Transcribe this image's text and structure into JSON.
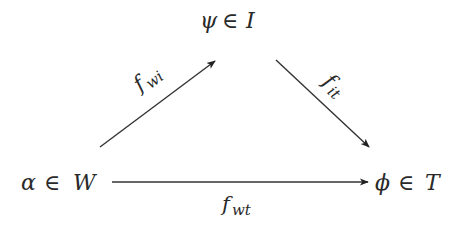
{
  "diagram": {
    "type": "commutative-diagram",
    "nodes": {
      "top": {
        "var": "ψ",
        "rel": "∈",
        "set": "I",
        "label": "ψ ∈ I"
      },
      "left": {
        "var": "α",
        "rel": "∈",
        "set": "W",
        "label": "α ∈ W"
      },
      "right": {
        "var": "ϕ",
        "rel": "∈",
        "set": "T",
        "label": "ϕ ∈ T"
      }
    },
    "edges": [
      {
        "id": "f_wi",
        "from": "left",
        "to": "top",
        "base": "f",
        "sub": "wi"
      },
      {
        "id": "f_it",
        "from": "top",
        "to": "right",
        "base": "f",
        "sub": "it"
      },
      {
        "id": "f_wt",
        "from": "left",
        "to": "right",
        "base": "f",
        "sub": "wt"
      }
    ],
    "colors": {
      "text": "#2a2a2a",
      "arrow": "#333333",
      "background": "#ffffff"
    }
  }
}
